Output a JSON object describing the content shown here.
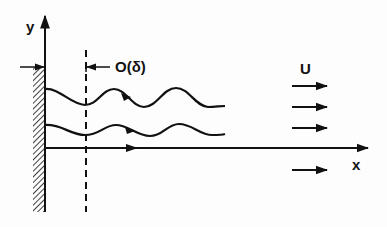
{
  "diagram": {
    "labels": {
      "y_axis": "y",
      "x_axis": "x",
      "velocity": "U",
      "boundary_layer_scale": "O(δ)"
    },
    "elements": {
      "wall": "hatched-flat-plate",
      "dashed_line": "boundary-layer-edge",
      "streamlines": [
        "upper-wavy-streamline",
        "lower-wavy-streamline",
        "straight-streamline"
      ],
      "free_stream_arrows": 4
    },
    "colors": {
      "ink": "#111111",
      "background": "#fdfdfd"
    }
  }
}
